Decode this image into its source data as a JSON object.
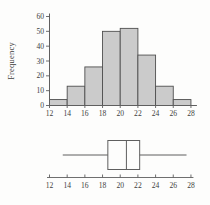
{
  "figure": {
    "background": "#fdfdfc",
    "line_color": "#5f5f5f",
    "text_color": "#3d3d3d"
  },
  "chart_data": [
    {
      "type": "bar",
      "subtype": "histogram",
      "title": "",
      "xlabel": "",
      "ylabel": "Frequency",
      "bin_edges": [
        12,
        14,
        16,
        18,
        20,
        22,
        24,
        26,
        28
      ],
      "values": [
        4,
        13,
        26,
        50,
        52,
        34,
        13,
        4
      ],
      "xticks": [
        12,
        14,
        16,
        18,
        20,
        22,
        24,
        26,
        28
      ],
      "yticks": [
        0,
        10,
        20,
        30,
        40,
        50,
        60
      ],
      "xlim": [
        12,
        28
      ],
      "ylim": [
        0,
        60
      ],
      "grid": false,
      "legend": false,
      "bar_fill": "#cbcbcb",
      "bar_stroke": "#4f4f4f"
    },
    {
      "type": "boxplot",
      "orientation": "horizontal",
      "whisker_min": 13.5,
      "q1": 18.6,
      "median": 20.7,
      "q3": 22.2,
      "whisker_max": 27.5,
      "xticks": [
        12,
        14,
        16,
        18,
        20,
        22,
        24,
        26,
        28
      ],
      "xlim": [
        12,
        28
      ],
      "box_fill": "none",
      "line_color": "#5f5f5f"
    }
  ]
}
